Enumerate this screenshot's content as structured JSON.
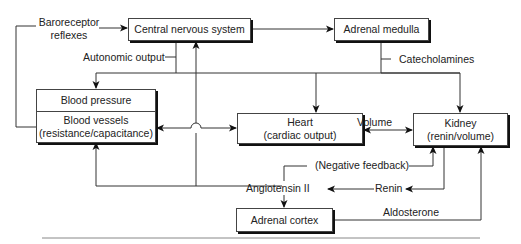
{
  "diagram": {
    "nodes": {
      "cns": {
        "label": "Central nervous system"
      },
      "adrenal_medulla": {
        "label": "Adrenal medulla"
      },
      "blood_pressure": {
        "label": "Blood pressure"
      },
      "blood_vessels": {
        "line1": "Blood vessels",
        "line2": "(resistance/capacitance)"
      },
      "heart": {
        "line1": "Heart",
        "line2": "(cardiac output)"
      },
      "kidney": {
        "line1": "Kidney",
        "line2": "(renin/volume)"
      },
      "adrenal_cortex": {
        "label": "Adrenal cortex"
      }
    },
    "labels": {
      "baroreceptor_line1": "Baroreceptor",
      "baroreceptor_line2": "reflexes",
      "autonomic_output": "Autonomic output",
      "catecholamines": "Catecholamines",
      "volume": "Volume",
      "negative_feedback": "(Negative feedback)",
      "angiotensin": "Angiotensin II",
      "renin": "Renin",
      "aldosterone": "Aldosterone"
    },
    "edges": [
      {
        "from": "Blood vessels",
        "to": "Central nervous system",
        "label": "Baroreceptor reflexes"
      },
      {
        "from": "Central nervous system",
        "to": "Adrenal medulla"
      },
      {
        "from": "Central nervous system",
        "to": "Blood pressure",
        "label": "Autonomic output"
      },
      {
        "from": "Central nervous system",
        "to": "Heart",
        "label": "Autonomic output"
      },
      {
        "from": "Adrenal medulla",
        "to": "Kidney",
        "label": "Catecholamines"
      },
      {
        "from": "Heart",
        "to": "Blood vessels",
        "bidirectional": true
      },
      {
        "from": "Heart",
        "to": "Kidney",
        "label": "Volume",
        "bidirectional": true
      },
      {
        "from": "Kidney",
        "to": "Angiotensin II",
        "label": "Renin"
      },
      {
        "from": "Angiotensin II",
        "to": "Kidney",
        "label": "(Negative feedback)"
      },
      {
        "from": "Angiotensin II",
        "to": "Blood vessels"
      },
      {
        "from": "Angiotensin II",
        "to": "Central nervous system"
      },
      {
        "from": "Angiotensin II",
        "to": "Adrenal cortex"
      },
      {
        "from": "Adrenal cortex",
        "to": "Kidney",
        "label": "Aldosterone"
      }
    ]
  }
}
